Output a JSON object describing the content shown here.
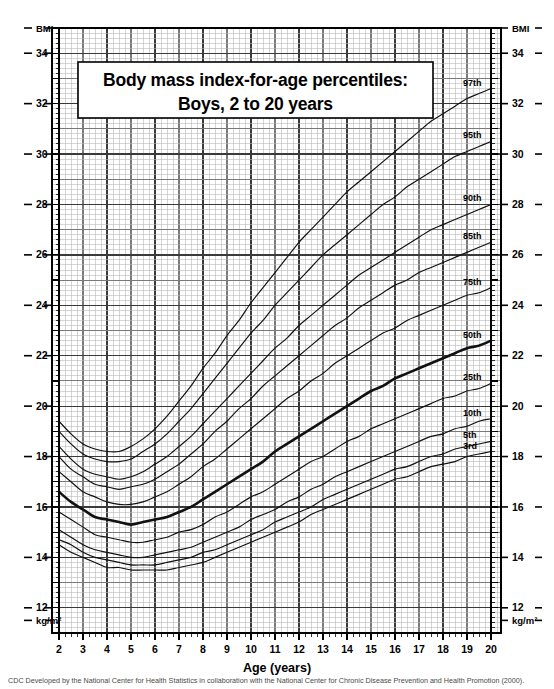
{
  "title": {
    "line1": "Body mass index-for-age percentiles:",
    "line2": "Boys, 2 to 20 years"
  },
  "axes": {
    "x_axis_title": "Age (years)",
    "y_axis_top_label_left": "BMI",
    "y_axis_top_label_right": "BMI",
    "y_axis_unit_label_left": "kg/m²",
    "y_axis_unit_label_right": "kg/m²",
    "x_tick_labels": [
      "2",
      "3",
      "4",
      "5",
      "6",
      "7",
      "8",
      "9",
      "10",
      "11",
      "12",
      "13",
      "14",
      "15",
      "16",
      "17",
      "18",
      "19",
      "20"
    ],
    "y_tick_labels": [
      "34",
      "32",
      "30",
      "28",
      "26",
      "24",
      "22",
      "20",
      "18",
      "16",
      "14",
      "12"
    ]
  },
  "caption": "CDC  Developed by the National Center for Health Statistics in collaboration with the National Center for Chronic Disease Prevention and Health Promotion (2000).",
  "colors": {
    "ink": "#000000",
    "grid_minor": "#b9b9b9",
    "grid_major": "#7a7a7a",
    "grid_heavy": "#3a3a3a",
    "curve": "#111111",
    "background": "#ffffff"
  },
  "chart_data": {
    "type": "line",
    "title": "Body mass index-for-age percentiles: Boys, 2 to 20 years",
    "xlabel": "Age (years)",
    "ylabel": "BMI",
    "yunit": "kg/m²",
    "xlim": [
      2,
      20
    ],
    "ylim": [
      11,
      35
    ],
    "grid": true,
    "legend_position": "right-inline-labels",
    "x": [
      2,
      2.5,
      3,
      3.5,
      4,
      4.5,
      5,
      5.5,
      6,
      6.5,
      7,
      7.5,
      8,
      8.5,
      9,
      9.5,
      10,
      10.5,
      11,
      11.5,
      12,
      12.5,
      13,
      13.5,
      14,
      14.5,
      15,
      15.5,
      16,
      16.5,
      17,
      17.5,
      18,
      18.5,
      19,
      19.5,
      20
    ],
    "series": [
      {
        "name": "97th",
        "label": "97th",
        "values": [
          19.4,
          18.9,
          18.5,
          18.3,
          18.2,
          18.2,
          18.4,
          18.7,
          19.1,
          19.6,
          20.2,
          20.8,
          21.5,
          22.1,
          22.8,
          23.4,
          24.1,
          24.7,
          25.3,
          25.9,
          26.5,
          27.0,
          27.5,
          28.0,
          28.5,
          28.9,
          29.3,
          29.7,
          30.1,
          30.5,
          30.9,
          31.3,
          31.6,
          31.9,
          32.2,
          32.4,
          32.6
        ]
      },
      {
        "name": "95th",
        "label": "95th",
        "values": [
          19.0,
          18.5,
          18.1,
          17.9,
          17.8,
          17.8,
          17.9,
          18.2,
          18.5,
          18.9,
          19.4,
          19.9,
          20.5,
          21.1,
          21.7,
          22.3,
          22.9,
          23.4,
          24.0,
          24.5,
          25.0,
          25.5,
          26.0,
          26.4,
          26.8,
          27.2,
          27.6,
          28.0,
          28.3,
          28.7,
          29.0,
          29.3,
          29.6,
          29.9,
          30.1,
          30.3,
          30.5
        ]
      },
      {
        "name": "90th",
        "label": "90th",
        "values": [
          18.4,
          17.9,
          17.5,
          17.3,
          17.2,
          17.1,
          17.2,
          17.4,
          17.7,
          18.0,
          18.4,
          18.8,
          19.3,
          19.8,
          20.3,
          20.8,
          21.3,
          21.8,
          22.3,
          22.7,
          23.2,
          23.6,
          24.0,
          24.4,
          24.8,
          25.2,
          25.5,
          25.8,
          26.1,
          26.4,
          26.7,
          27.0,
          27.2,
          27.4,
          27.6,
          27.8,
          28.0
        ]
      },
      {
        "name": "85th",
        "label": "85th",
        "values": [
          18.0,
          17.5,
          17.2,
          16.9,
          16.8,
          16.7,
          16.8,
          16.9,
          17.1,
          17.4,
          17.7,
          18.1,
          18.5,
          19.0,
          19.4,
          19.9,
          20.3,
          20.8,
          21.2,
          21.6,
          22.0,
          22.4,
          22.8,
          23.2,
          23.5,
          23.9,
          24.2,
          24.5,
          24.8,
          25.0,
          25.3,
          25.5,
          25.7,
          25.9,
          26.1,
          26.3,
          26.5
        ]
      },
      {
        "name": "75th",
        "label": "75th",
        "values": [
          17.4,
          17.0,
          16.6,
          16.4,
          16.2,
          16.1,
          16.1,
          16.2,
          16.4,
          16.6,
          16.9,
          17.2,
          17.6,
          17.9,
          18.3,
          18.7,
          19.1,
          19.5,
          19.9,
          20.3,
          20.6,
          21.0,
          21.3,
          21.7,
          22.0,
          22.3,
          22.6,
          22.9,
          23.1,
          23.4,
          23.6,
          23.8,
          24.0,
          24.2,
          24.4,
          24.5,
          24.7
        ]
      },
      {
        "name": "50th",
        "label": "50th",
        "values": [
          16.6,
          16.2,
          15.9,
          15.6,
          15.5,
          15.4,
          15.3,
          15.4,
          15.5,
          15.6,
          15.8,
          16.0,
          16.3,
          16.6,
          16.9,
          17.2,
          17.5,
          17.8,
          18.2,
          18.5,
          18.8,
          19.1,
          19.4,
          19.7,
          20.0,
          20.3,
          20.6,
          20.8,
          21.1,
          21.3,
          21.5,
          21.7,
          21.9,
          22.1,
          22.3,
          22.4,
          22.6
        ]
      },
      {
        "name": "25th",
        "label": "25th",
        "values": [
          15.8,
          15.5,
          15.2,
          14.9,
          14.8,
          14.7,
          14.6,
          14.6,
          14.7,
          14.8,
          15.0,
          15.1,
          15.3,
          15.6,
          15.8,
          16.1,
          16.4,
          16.6,
          16.9,
          17.2,
          17.5,
          17.8,
          18.0,
          18.3,
          18.6,
          18.8,
          19.1,
          19.3,
          19.5,
          19.7,
          19.9,
          20.1,
          20.3,
          20.4,
          20.6,
          20.7,
          20.9
        ]
      },
      {
        "name": "10th",
        "label": "10th",
        "values": [
          15.1,
          14.8,
          14.5,
          14.3,
          14.2,
          14.1,
          14.0,
          14.0,
          14.1,
          14.2,
          14.3,
          14.4,
          14.6,
          14.8,
          15.0,
          15.2,
          15.5,
          15.7,
          15.9,
          16.2,
          16.4,
          16.7,
          16.9,
          17.2,
          17.4,
          17.6,
          17.8,
          18.0,
          18.2,
          18.4,
          18.6,
          18.8,
          18.9,
          19.1,
          19.2,
          19.4,
          19.5
        ]
      },
      {
        "name": "5th",
        "label": "5th",
        "values": [
          14.7,
          14.5,
          14.2,
          14.0,
          13.9,
          13.8,
          13.7,
          13.7,
          13.7,
          13.8,
          13.9,
          14.0,
          14.2,
          14.3,
          14.5,
          14.7,
          14.9,
          15.1,
          15.4,
          15.6,
          15.8,
          16.0,
          16.3,
          16.5,
          16.7,
          16.9,
          17.1,
          17.3,
          17.5,
          17.6,
          17.8,
          18.0,
          18.1,
          18.3,
          18.4,
          18.5,
          18.6
        ]
      },
      {
        "name": "3rd",
        "label": "3rd",
        "values": [
          14.5,
          14.2,
          14.0,
          13.8,
          13.6,
          13.6,
          13.5,
          13.5,
          13.5,
          13.5,
          13.6,
          13.7,
          13.8,
          14.0,
          14.2,
          14.4,
          14.6,
          14.8,
          15.0,
          15.2,
          15.4,
          15.7,
          15.9,
          16.1,
          16.3,
          16.5,
          16.7,
          16.9,
          17.1,
          17.2,
          17.4,
          17.6,
          17.7,
          17.8,
          18.0,
          18.1,
          18.2
        ]
      }
    ],
    "percentile_label_positions": {
      "97th": 32.6,
      "95th": 30.5,
      "90th": 28.0,
      "85th": 26.5,
      "75th": 24.7,
      "50th": 22.6,
      "25th": 20.9,
      "10th": 19.5,
      "5th": 18.6,
      "3rd": 18.2
    }
  }
}
